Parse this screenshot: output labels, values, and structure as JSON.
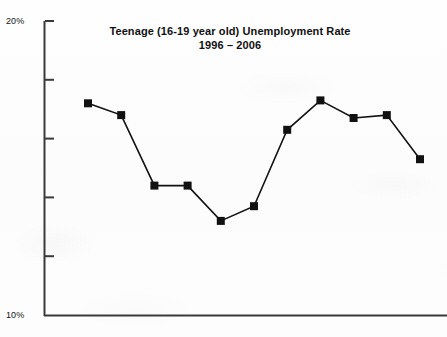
{
  "figure": {
    "title_line1": "Teenage (16-19 year old) Unemployment Rate",
    "title_line2": "1996 – 2006",
    "axis_top_label": "20%",
    "axis_bottom_label": "10%",
    "line_color": "#111111",
    "marker_color": "#111111",
    "axis_color": "#3a3a3a",
    "background_color": "#fdfdfd"
  },
  "chart_data": {
    "type": "line",
    "title": "Teenage (16-19 year old) Unemployment Rate 1996 – 2006",
    "subtitle": "1996 – 2006",
    "xlabel": "",
    "ylabel": "",
    "ylim": [
      10,
      20
    ],
    "yticks": [
      10,
      12,
      14,
      16,
      18,
      20
    ],
    "ytick_labels_shown": [
      "10%",
      "20%"
    ],
    "grid": false,
    "legend": false,
    "marker": "square",
    "categories": [
      "1996",
      "1997",
      "1998",
      "1999",
      "2000",
      "2001",
      "2002",
      "2003",
      "2004",
      "2005",
      "2006"
    ],
    "x": [
      1996,
      1997,
      1998,
      1999,
      2000,
      2001,
      2002,
      2003,
      2004,
      2005,
      2006
    ],
    "values": [
      17.2,
      16.8,
      14.4,
      14.4,
      13.2,
      13.7,
      16.3,
      17.3,
      16.7,
      16.8,
      15.3
    ],
    "units": "percent"
  }
}
